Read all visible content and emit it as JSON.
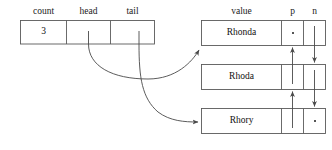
{
  "diagram": {
    "type": "linked-list-diagram"
  },
  "header_record": {
    "columns": [
      {
        "label": "count",
        "value": "3"
      },
      {
        "label": "head",
        "value": ""
      },
      {
        "label": "tail",
        "value": ""
      }
    ]
  },
  "node_headers": {
    "value": "value",
    "prev": "p",
    "next": "n"
  },
  "nodes": [
    {
      "value": "Rhonda",
      "prev": "null-dot",
      "next": "pointer-down"
    },
    {
      "value": "Rhoda",
      "prev": "pointer-up",
      "next": "pointer-down"
    },
    {
      "value": "Rhory",
      "prev": "pointer-up",
      "next": "null-dot"
    }
  ],
  "pointers": [
    {
      "name": "head-pointer",
      "from": "head",
      "to": "Rhonda"
    },
    {
      "name": "tail-pointer",
      "from": "tail",
      "to": "Rhory"
    }
  ],
  "colors": {
    "stroke": "#5a5a5a",
    "text": "#111111",
    "background": "#ffffff"
  }
}
